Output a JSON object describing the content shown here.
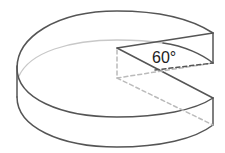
{
  "diagram": {
    "angle_label": "60°",
    "colors": {
      "outline": "#555555",
      "hidden_line": "#bbbbbb",
      "back_arc": "#c8c8c8",
      "background": "#ffffff",
      "text": "#222222"
    }
  }
}
